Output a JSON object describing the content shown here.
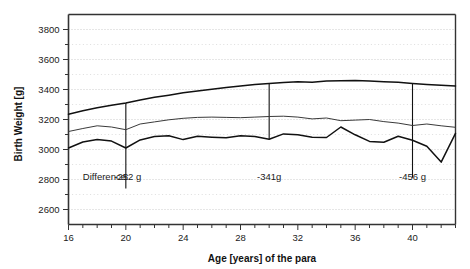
{
  "chart_data": {
    "type": "line",
    "title": "",
    "xlabel": "Age [years] of the para",
    "ylabel": "Birth Weight [g]",
    "xlim": [
      16,
      43
    ],
    "ylim": [
      2500,
      3900
    ],
    "xticks_major": [
      16,
      20,
      24,
      28,
      32,
      36,
      40
    ],
    "xticks_major_labels": [
      "16",
      "20",
      "24",
      "28",
      "32",
      "36",
      "40"
    ],
    "xtick_minor_step": 1,
    "yticks_major": [
      2600,
      2800,
      3000,
      3200,
      3400,
      3600,
      3800
    ],
    "yticks_major_labels": [
      "2600",
      "2800",
      "3000",
      "3200",
      "3400",
      "3600",
      "3800"
    ],
    "ytick_minor_step": 100,
    "grid": "horizontal-dotted",
    "legend": "none",
    "x": [
      16,
      17,
      18,
      19,
      20,
      21,
      22,
      23,
      24,
      25,
      26,
      27,
      28,
      29,
      30,
      31,
      32,
      33,
      34,
      35,
      36,
      37,
      38,
      39,
      40,
      41,
      42,
      43
    ],
    "series": [
      {
        "name": "upper",
        "style": "thick-dark",
        "values": [
          3235,
          3258,
          3278,
          3295,
          3310,
          3330,
          3348,
          3362,
          3378,
          3390,
          3402,
          3414,
          3424,
          3434,
          3440,
          3446,
          3452,
          3448,
          3456,
          3458,
          3460,
          3456,
          3452,
          3448,
          3440,
          3434,
          3428,
          3424
        ]
      },
      {
        "name": "middle",
        "style": "thin-dark",
        "values": [
          3120,
          3140,
          3158,
          3150,
          3132,
          3170,
          3184,
          3198,
          3208,
          3214,
          3216,
          3214,
          3212,
          3216,
          3220,
          3222,
          3216,
          3204,
          3210,
          3192,
          3196,
          3200,
          3186,
          3176,
          3160,
          3170,
          3158,
          3148
        ]
      },
      {
        "name": "lower",
        "style": "thick-dark",
        "values": [
          3010,
          3050,
          3066,
          3056,
          3010,
          3064,
          3086,
          3092,
          3066,
          3088,
          3082,
          3078,
          3092,
          3086,
          3068,
          3104,
          3098,
          3082,
          3080,
          3150,
          3098,
          3054,
          3048,
          3088,
          3062,
          3022,
          2916,
          3108
        ]
      }
    ],
    "annotations": [
      {
        "label": "Difference:",
        "x": 17.0,
        "y": 2795,
        "kind": "text",
        "align": "start"
      },
      {
        "label": "-252 g",
        "x": 19.2,
        "y": 2795,
        "kind": "text",
        "align": "start"
      },
      {
        "label": "-341g",
        "x": 30.0,
        "y": 2795,
        "kind": "text",
        "align": "middle"
      },
      {
        "label": "-456 g",
        "x": 40.0,
        "y": 2795,
        "kind": "text",
        "align": "middle"
      }
    ],
    "difference_bars": [
      {
        "x": 20,
        "y_top": 3310,
        "y_bottom": 2740,
        "value": -252
      },
      {
        "x": 30,
        "y_top": 3440,
        "y_bottom": 3068,
        "value": -341
      },
      {
        "x": 40,
        "y_top": 3440,
        "y_bottom": 2812,
        "value": -456
      }
    ]
  },
  "colors": {
    "axis": "#333333",
    "grid": "#bdbdbd",
    "line_thick": "#111111",
    "line_thin": "#3a3a3a",
    "text": "#1a1a1a",
    "background": "#ffffff"
  }
}
